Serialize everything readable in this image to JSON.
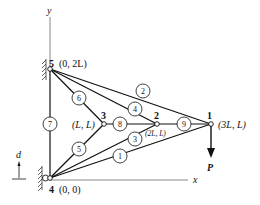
{
  "diagram": {
    "type": "plane truss",
    "axes": {
      "x_label": "x",
      "y_label": "y"
    },
    "nodes": [
      {
        "id": "1",
        "coord": "(3L, L)",
        "x": 211,
        "y": 124
      },
      {
        "id": "2",
        "coord": "(2L, L)",
        "x": 157,
        "y": 124
      },
      {
        "id": "3",
        "coord": "(L, L)",
        "x": 104,
        "y": 124
      },
      {
        "id": "4",
        "coord": "(0, 0)",
        "x": 50,
        "y": 178
      },
      {
        "id": "5",
        "coord": "(0, 2L)",
        "x": 50,
        "y": 69
      }
    ],
    "elements": [
      {
        "id": "1",
        "from": "4",
        "to": "1",
        "lx": 120,
        "ly": 156
      },
      {
        "id": "2",
        "from": "5",
        "to": "1",
        "lx": 143,
        "ly": 91
      },
      {
        "id": "3",
        "from": "4",
        "to": "2",
        "lx": 135,
        "ly": 139
      },
      {
        "id": "4",
        "from": "5",
        "to": "2",
        "lx": 135,
        "ly": 109
      },
      {
        "id": "5",
        "from": "4",
        "to": "3",
        "lx": 79,
        "ly": 149
      },
      {
        "id": "6",
        "from": "5",
        "to": "3",
        "lx": 79,
        "ly": 98
      },
      {
        "id": "7",
        "from": "4",
        "to": "5",
        "lx": 50,
        "ly": 124
      },
      {
        "id": "8",
        "from": "3",
        "to": "2",
        "lx": 120,
        "ly": 124
      },
      {
        "id": "9",
        "from": "2",
        "to": "1",
        "lx": 184,
        "ly": 124
      }
    ],
    "load": {
      "label": "P",
      "node": "1",
      "direction": "down"
    },
    "displacement": {
      "label": "d",
      "direction": "up"
    }
  }
}
